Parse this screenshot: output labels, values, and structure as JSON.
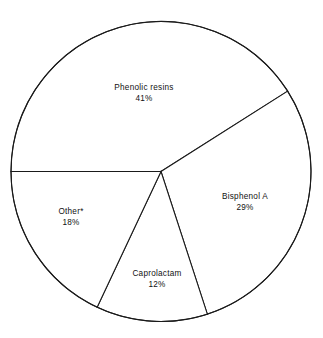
{
  "chart_data": {
    "type": "pie",
    "title": "",
    "subtitle": "",
    "xlabel": "",
    "ylabel": "",
    "legend_position": "none",
    "grid": false,
    "units": "percent",
    "total": 100,
    "categories": [
      "Phenolic resins",
      "Bisphenol A",
      "Caprolactam",
      "Other*"
    ],
    "values": [
      41,
      29,
      12,
      18
    ],
    "labels": [
      "41%",
      "29%",
      "12%",
      "18%"
    ],
    "slices": [
      {
        "name": "Phenolic resins",
        "value": 41,
        "value_label": "41%",
        "start_angle_deg": 180,
        "end_angle_deg": 327.6,
        "label_x": 144,
        "label_y": 94
      },
      {
        "name": "Bisphenol A",
        "value": 29,
        "value_label": "29%",
        "start_angle_deg": 327.6,
        "end_angle_deg": 72,
        "label_x": 245,
        "label_y": 203
      },
      {
        "name": "Caprolactam",
        "value": 12,
        "value_label": "12%",
        "start_angle_deg": 72,
        "end_angle_deg": 115.2,
        "label_x": 157,
        "label_y": 280
      },
      {
        "name": "Other*",
        "value": 18,
        "value_label": "18%",
        "start_angle_deg": 115.2,
        "end_angle_deg": 180,
        "label_x": 71,
        "label_y": 218
      }
    ],
    "geometry": {
      "center_x": 161,
      "center_y": 171.5,
      "radius": 150
    },
    "colors": {
      "background": "#ffffff",
      "slice_fill": "#ffffff",
      "stroke": "#1a1a1a",
      "text": "#111111"
    }
  }
}
